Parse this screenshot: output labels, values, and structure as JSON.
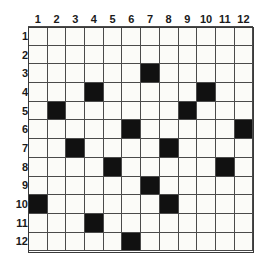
{
  "puzzle": {
    "kind": "grid-puzzle",
    "rows": 12,
    "columns": 12,
    "column_headers": [
      "1",
      "2",
      "3",
      "4",
      "5",
      "6",
      "7",
      "8",
      "9",
      "10",
      "11",
      "12"
    ],
    "row_headers": [
      "1",
      "2",
      "3",
      "4",
      "5",
      "6",
      "7",
      "8",
      "9",
      "10",
      "11",
      "12"
    ],
    "colors": {
      "filled_cell": "#111111",
      "empty_cell": "#fbfbf8",
      "grid_line": "#4a4a4a",
      "label_text": "#1a1a1a",
      "background": "#ffffff"
    },
    "filled_cells_by_row": {
      "1": [],
      "2": [],
      "3": [
        7
      ],
      "4": [
        4,
        10
      ],
      "5": [
        2,
        9
      ],
      "6": [
        6,
        12
      ],
      "7": [
        3,
        8
      ],
      "8": [
        5,
        11
      ],
      "9": [
        7
      ],
      "10": [
        1,
        8
      ],
      "11": [
        4
      ],
      "12": [
        6
      ]
    },
    "filled_cell_count": 17,
    "cells": [
      [
        0,
        0,
        0,
        0,
        0,
        0,
        0,
        0,
        0,
        0,
        0,
        0
      ],
      [
        0,
        0,
        0,
        0,
        0,
        0,
        0,
        0,
        0,
        0,
        0,
        0
      ],
      [
        0,
        0,
        0,
        0,
        0,
        0,
        1,
        0,
        0,
        0,
        0,
        0
      ],
      [
        0,
        0,
        0,
        1,
        0,
        0,
        0,
        0,
        0,
        1,
        0,
        0
      ],
      [
        0,
        1,
        0,
        0,
        0,
        0,
        0,
        0,
        1,
        0,
        0,
        0
      ],
      [
        0,
        0,
        0,
        0,
        0,
        1,
        0,
        0,
        0,
        0,
        0,
        1
      ],
      [
        0,
        0,
        1,
        0,
        0,
        0,
        0,
        1,
        0,
        0,
        0,
        0
      ],
      [
        0,
        0,
        0,
        0,
        1,
        0,
        0,
        0,
        0,
        0,
        1,
        0
      ],
      [
        0,
        0,
        0,
        0,
        0,
        0,
        1,
        0,
        0,
        0,
        0,
        0
      ],
      [
        1,
        0,
        0,
        0,
        0,
        0,
        0,
        1,
        0,
        0,
        0,
        0
      ],
      [
        0,
        0,
        0,
        1,
        0,
        0,
        0,
        0,
        0,
        0,
        0,
        0
      ],
      [
        0,
        0,
        0,
        0,
        0,
        1,
        0,
        0,
        0,
        0,
        0,
        0
      ]
    ]
  }
}
